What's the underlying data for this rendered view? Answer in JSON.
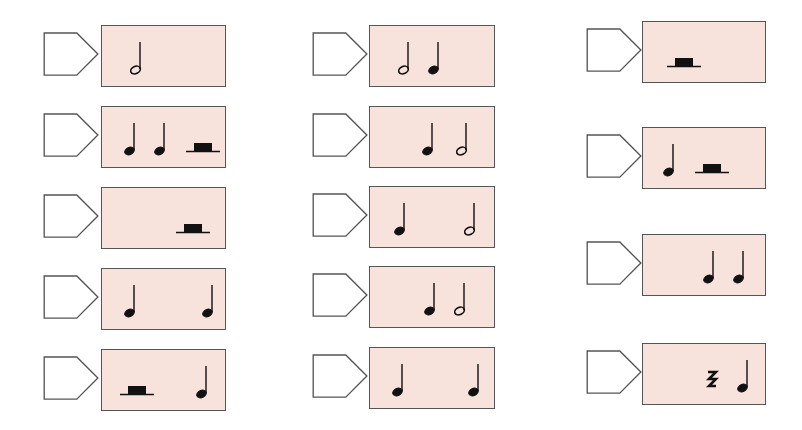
{
  "worksheet": {
    "title": "Rhythm note-value cards",
    "colors": {
      "card_fill": "#f8e2dc",
      "outline": "#555555",
      "tag_fill": "#ffffff",
      "note": "#111111"
    },
    "columns": [
      {
        "cards": [
          {
            "tag_answer": "",
            "symbols": [
              {
                "type": "half-note",
                "x": 28
              }
            ]
          },
          {
            "tag_answer": "",
            "symbols": [
              {
                "type": "quarter-note",
                "x": 22
              },
              {
                "type": "quarter-note",
                "x": 52
              },
              {
                "type": "half-rest",
                "x": 80
              }
            ]
          },
          {
            "tag_answer": "",
            "symbols": [
              {
                "type": "half-rest",
                "x": 70
              }
            ]
          },
          {
            "tag_answer": "",
            "symbols": [
              {
                "type": "quarter-note",
                "x": 22
              },
              {
                "type": "quarter-note",
                "x": 100
              }
            ]
          },
          {
            "tag_answer": "",
            "symbols": [
              {
                "type": "half-rest",
                "x": 14
              },
              {
                "type": "quarter-note",
                "x": 94
              }
            ]
          }
        ]
      },
      {
        "cards": [
          {
            "tag_answer": "",
            "symbols": [
              {
                "type": "half-note",
                "x": 28
              },
              {
                "type": "quarter-note",
                "x": 58
              }
            ]
          },
          {
            "tag_answer": "",
            "symbols": [
              {
                "type": "quarter-note",
                "x": 52
              },
              {
                "type": "half-note",
                "x": 86
              }
            ]
          },
          {
            "tag_answer": "",
            "symbols": [
              {
                "type": "quarter-note",
                "x": 24
              },
              {
                "type": "half-note",
                "x": 94
              }
            ]
          },
          {
            "tag_answer": "",
            "symbols": [
              {
                "type": "quarter-note",
                "x": 54
              },
              {
                "type": "half-note",
                "x": 84
              }
            ]
          },
          {
            "tag_answer": "",
            "symbols": [
              {
                "type": "quarter-note",
                "x": 22
              },
              {
                "type": "quarter-note",
                "x": 98
              }
            ]
          }
        ]
      },
      {
        "cards": [
          {
            "tag_answer": "",
            "symbols": [
              {
                "type": "half-rest",
                "x": 20
              }
            ]
          },
          {
            "tag_answer": "",
            "symbols": [
              {
                "type": "quarter-note",
                "x": 20
              },
              {
                "type": "half-rest",
                "x": 48
              }
            ]
          },
          {
            "tag_answer": "",
            "symbols": [
              {
                "type": "quarter-note",
                "x": 60
              },
              {
                "type": "quarter-note",
                "x": 90
              }
            ]
          },
          {
            "tag_answer": "",
            "symbols": [
              {
                "type": "quarter-rest",
                "x": 62
              },
              {
                "type": "quarter-note",
                "x": 94
              }
            ]
          }
        ]
      }
    ]
  }
}
